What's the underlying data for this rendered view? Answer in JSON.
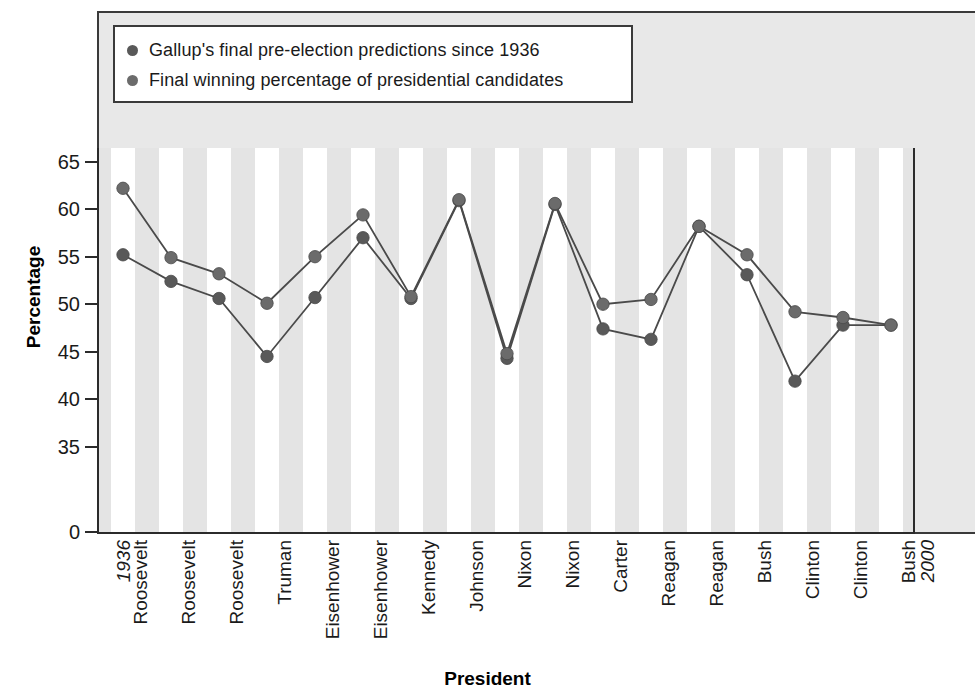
{
  "chart_data": {
    "type": "line",
    "title": "",
    "xlabel": "President",
    "ylabel": "Percentage",
    "ylim": [
      0,
      67
    ],
    "ytick_labels": [
      "0",
      "35",
      "40",
      "45",
      "50",
      "55",
      "60",
      "65"
    ],
    "ytick_values": [
      0,
      35,
      40,
      45,
      50,
      55,
      60,
      65
    ],
    "axis_break": true,
    "grid": false,
    "banded_background": true,
    "legend_position": "top-left",
    "categories": [
      "Roosevelt",
      "Roosevelt",
      "Roosevelt",
      "Truman",
      "Eisenhower",
      "Eisenhower",
      "Kennedy",
      "Johnson",
      "Nixon",
      "Nixon",
      "Carter",
      "Reagan",
      "Reagan",
      "Bush",
      "Clinton",
      "Clinton",
      "Bush"
    ],
    "x_endpoint_start": "1936",
    "x_endpoint_end": "2000",
    "series": [
      {
        "name": "Gallup's final pre-election predictions since 1936",
        "color": "#595959",
        "values": [
          55.2,
          52.4,
          50.6,
          44.5,
          50.7,
          57.0,
          50.6,
          60.9,
          44.3,
          60.5,
          47.4,
          46.3,
          58.2,
          53.1,
          41.9,
          47.8,
          47.8
        ]
      },
      {
        "name": "Final winning percentage of presidential candidates",
        "color": "#595959",
        "values": [
          62.2,
          54.9,
          53.2,
          50.1,
          55.0,
          59.4,
          50.8,
          61.0,
          44.8,
          60.6,
          50.0,
          50.5,
          58.2,
          55.2,
          49.2,
          48.6,
          47.8
        ]
      }
    ]
  },
  "legend": {
    "items": [
      {
        "label": "Gallup's final pre-election predictions since 1936",
        "color": "#595959"
      },
      {
        "label": "Final winning percentage of presidential candidates",
        "color": "#6b6b6b"
      }
    ]
  },
  "axis": {
    "y_title": "Percentage",
    "x_title": "President"
  },
  "colors": {
    "panel_background": "#e8e8e8",
    "band": "#e4e4e4",
    "marker": "#595959",
    "line": "#4a4a4a",
    "axis": "#2b2b2b"
  }
}
